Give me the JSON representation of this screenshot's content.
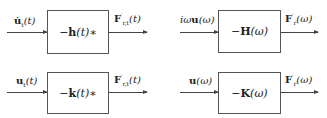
{
  "diagram": {
    "type": "block-diagram",
    "blocks": [
      {
        "id": "top-left",
        "input": {
          "prefix": "",
          "symbol": "u̇",
          "sub": "t",
          "arg": "(t)"
        },
        "transfer": {
          "sign": "−",
          "symbol": "h",
          "arg": "(t)",
          "op": " ∗"
        },
        "output": {
          "symbol": "F",
          "prime": "′",
          "sub": "r,t",
          "arg": "(t)"
        }
      },
      {
        "id": "top-right",
        "input": {
          "prefix": "iω",
          "symbol": "u",
          "sub": "",
          "arg": "(ω)"
        },
        "transfer": {
          "sign": "−",
          "symbol": "H",
          "arg": "(ω)",
          "op": ""
        },
        "output": {
          "symbol": "F",
          "prime": "′",
          "sub": "r",
          "arg": "(ω)"
        }
      },
      {
        "id": "bottom-left",
        "input": {
          "prefix": "",
          "symbol": "u",
          "sub": "t",
          "arg": "(t)"
        },
        "transfer": {
          "sign": "−",
          "symbol": "k",
          "arg": "(t)",
          "op": " ∗"
        },
        "output": {
          "symbol": "F",
          "prime": "′",
          "sub": "r,t",
          "arg": "(t)"
        }
      },
      {
        "id": "bottom-right",
        "input": {
          "prefix": "",
          "symbol": "u",
          "sub": "",
          "arg": "(ω)"
        },
        "transfer": {
          "sign": "−",
          "symbol": "K",
          "arg": "(ω)",
          "op": ""
        },
        "output": {
          "symbol": "F",
          "prime": "′",
          "sub": "r",
          "arg": "(ω)"
        }
      }
    ]
  }
}
